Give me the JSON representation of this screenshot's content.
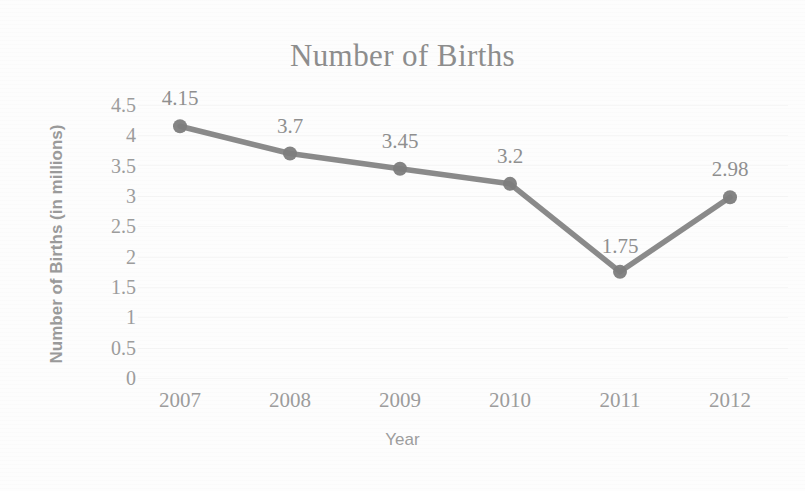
{
  "chart_data": {
    "type": "line",
    "title": "Number of Births",
    "xlabel": "Year",
    "ylabel": "Number of Births (in millions)",
    "categories": [
      "2007",
      "2008",
      "2009",
      "2010",
      "2011",
      "2012"
    ],
    "values": [
      4.15,
      3.7,
      3.45,
      3.2,
      1.75,
      2.98
    ],
    "data_labels": [
      "4.15",
      "3.7",
      "3.45",
      "3.2",
      "1.75",
      "2.98"
    ],
    "ylim": [
      0,
      4.5
    ],
    "ytick_labels": [
      "0",
      "0.5",
      "1",
      "1.5",
      "2",
      "2.5",
      "3",
      "3.5",
      "4",
      "4.5"
    ],
    "ytick_values": [
      0,
      0.5,
      1,
      1.5,
      2,
      2.5,
      3,
      3.5,
      4,
      4.5
    ],
    "grid": true,
    "legend": "none",
    "series": [
      {
        "name": "Number of Births",
        "values": [
          4.15,
          3.7,
          3.45,
          3.2,
          1.75,
          2.98
        ]
      }
    ],
    "colors": {
      "line": "#808080",
      "marker": "#7d7d7d",
      "text": "#9a9a9a",
      "title": "#8d8d8d",
      "background": "#fdfdfd",
      "grid": "#f2f2f2"
    }
  }
}
